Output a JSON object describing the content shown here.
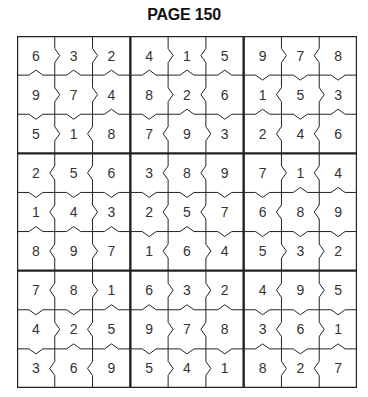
{
  "page": {
    "title": "PAGE 150"
  },
  "puzzle": {
    "type": "greater-than-sudoku",
    "colors": {
      "line": "#222222",
      "digit": "#333333",
      "background": "#ffffff"
    },
    "grid": [
      [
        6,
        3,
        2,
        4,
        1,
        5,
        9,
        7,
        8
      ],
      [
        9,
        7,
        4,
        8,
        2,
        6,
        1,
        5,
        3
      ],
      [
        5,
        1,
        8,
        7,
        9,
        3,
        2,
        4,
        6
      ],
      [
        2,
        5,
        6,
        3,
        8,
        9,
        7,
        1,
        4
      ],
      [
        1,
        4,
        3,
        2,
        5,
        7,
        6,
        8,
        9
      ],
      [
        8,
        9,
        7,
        1,
        6,
        4,
        5,
        3,
        2
      ],
      [
        7,
        8,
        1,
        6,
        3,
        2,
        4,
        9,
        5
      ],
      [
        4,
        2,
        5,
        9,
        7,
        8,
        3,
        6,
        1
      ],
      [
        3,
        6,
        9,
        5,
        4,
        1,
        8,
        2,
        7
      ]
    ]
  }
}
